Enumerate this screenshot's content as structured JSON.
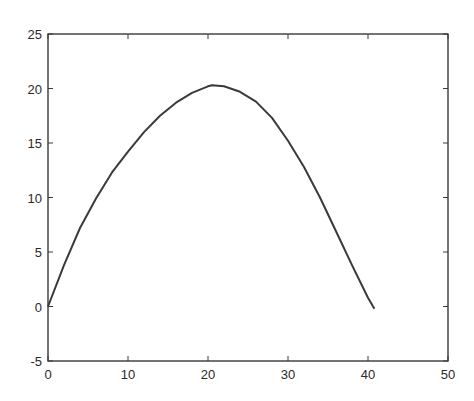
{
  "chart_data": {
    "type": "line",
    "title": "",
    "xlabel": "",
    "ylabel": "",
    "xlim": [
      0,
      50
    ],
    "ylim": [
      -5,
      25
    ],
    "grid": false,
    "legend": null,
    "x_ticks": [
      "0",
      "10",
      "20",
      "30",
      "40",
      "50"
    ],
    "y_ticks": [
      "25",
      "20",
      "15",
      "10",
      "5",
      "0",
      "-5"
    ],
    "series": [
      {
        "name": "trajectory",
        "color": "#3a3a3a",
        "x": [
          0,
          2,
          4,
          6,
          8,
          10,
          12,
          14,
          16,
          18,
          20,
          20.5,
          22,
          24,
          26,
          28,
          30,
          32,
          34,
          36,
          38,
          40,
          40.8
        ],
        "y": [
          0,
          3.8,
          7.2,
          9.9,
          12.3,
          14.2,
          16.0,
          17.5,
          18.7,
          19.6,
          20.2,
          20.3,
          20.2,
          19.7,
          18.8,
          17.3,
          15.2,
          12.8,
          10.0,
          6.9,
          3.8,
          0.8,
          -0.2
        ]
      }
    ]
  }
}
